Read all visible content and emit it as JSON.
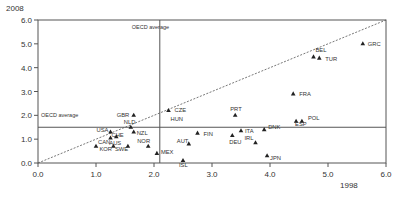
{
  "chart_data": {
    "type": "scatter",
    "title": "",
    "xlabel": "1998",
    "ylabel": "2008",
    "xlim": [
      0,
      6
    ],
    "ylim": [
      0,
      6
    ],
    "x_ticks": [
      "0.0",
      "1.0",
      "2.0",
      "3.0",
      "4.0",
      "5.0",
      "6.0"
    ],
    "y_ticks": [
      "0.0",
      "1.0",
      "2.0",
      "3.0",
      "4.0",
      "5.0",
      "6.0"
    ],
    "grid": false,
    "legend": "none",
    "marker": "triangle",
    "reference_lines": {
      "diagonal": {
        "from": [
          0,
          0
        ],
        "to": [
          6,
          6
        ],
        "style": "dotted"
      },
      "horizontal_oecd_average": {
        "y": 1.5,
        "label": "OECD average"
      },
      "vertical_oecd_average": {
        "x": 2.1,
        "label": "OECD average"
      }
    },
    "points": [
      {
        "label": "GRC",
        "x": 5.6,
        "y": 5.0
      },
      {
        "label": "BEL",
        "x": 4.75,
        "y": 4.45
      },
      {
        "label": "TUR",
        "x": 4.85,
        "y": 4.4
      },
      {
        "label": "FRA",
        "x": 4.4,
        "y": 2.9
      },
      {
        "label": "PRT",
        "x": 3.4,
        "y": 2.0
      },
      {
        "label": "CZE",
        "x": 2.25,
        "y": 2.2
      },
      {
        "label": "HUN",
        "x": 2.25,
        "y": 2.2
      },
      {
        "label": "GBR",
        "x": 1.65,
        "y": 2.0
      },
      {
        "label": "POL",
        "x": 4.55,
        "y": 1.75
      },
      {
        "label": "ESP",
        "x": 4.45,
        "y": 1.75
      },
      {
        "label": "ITA",
        "x": 3.5,
        "y": 1.35
      },
      {
        "label": "DNK",
        "x": 3.9,
        "y": 1.4
      },
      {
        "label": "IRL",
        "x": 3.75,
        "y": 0.85
      },
      {
        "label": "DEU",
        "x": 3.35,
        "y": 1.15
      },
      {
        "label": "JPN",
        "x": 3.95,
        "y": 0.3
      },
      {
        "label": "FIN",
        "x": 2.75,
        "y": 1.25
      },
      {
        "label": "AUT",
        "x": 2.6,
        "y": 0.8
      },
      {
        "label": "ISL",
        "x": 2.5,
        "y": 0.1
      },
      {
        "label": "MEX",
        "x": 2.05,
        "y": 0.4
      },
      {
        "label": "NOR",
        "x": 1.9,
        "y": 0.7
      },
      {
        "label": "SWE",
        "x": 1.55,
        "y": 0.7
      },
      {
        "label": "NLD",
        "x": 1.6,
        "y": 1.5
      },
      {
        "label": "NZL",
        "x": 1.65,
        "y": 1.3
      },
      {
        "label": "USA",
        "x": 1.25,
        "y": 1.3
      },
      {
        "label": "CHE",
        "x": 1.25,
        "y": 1.05
      },
      {
        "label": "AUS",
        "x": 1.35,
        "y": 1.1
      },
      {
        "label": "CAN",
        "x": 1.0,
        "y": 0.7
      },
      {
        "label": "KOR",
        "x": 1.3,
        "y": 0.7
      }
    ],
    "label_offsets": {
      "GRC": [
        5,
        2
      ],
      "BEL": [
        2,
        -5
      ],
      "TUR": [
        6,
        3
      ],
      "FRA": [
        6,
        2
      ],
      "PRT": [
        -5,
        -4
      ],
      "CZE": [
        6,
        1
      ],
      "HUN": [
        2,
        10
      ],
      "GBR": [
        -17,
        2
      ],
      "POL": [
        6,
        -1
      ],
      "ESP": [
        -1,
        5
      ],
      "ITA": [
        4,
        2
      ],
      "DNK": [
        4,
        -1
      ],
      "IRL": [
        -11,
        -3
      ],
      "DEU": [
        -3,
        8
      ],
      "JPN": [
        3,
        4
      ],
      "FIN": [
        6,
        3
      ],
      "AUT": [
        -12,
        -1
      ],
      "ISL": [
        -4,
        6
      ],
      "MEX": [
        4,
        1
      ],
      "NOR": [
        -11,
        -3
      ],
      "SWE": [
        -13,
        5
      ],
      "NLD": [
        -7,
        -3
      ],
      "NZL": [
        3,
        3
      ],
      "USA": [
        -14,
        0
      ],
      "CHE": [
        1,
        -1
      ],
      "AUS": [
        -7,
        8
      ],
      "CAN": [
        2,
        -2
      ],
      "KOR": [
        -14,
        5
      ]
    }
  }
}
